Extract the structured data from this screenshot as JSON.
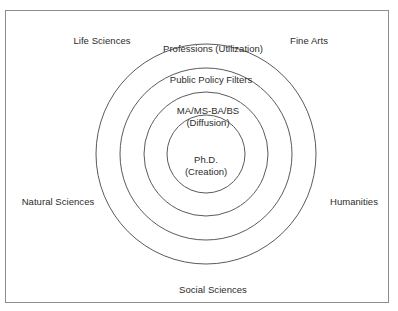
{
  "diagram": {
    "type": "concentric-circles",
    "title": "",
    "background_color": "#ffffff",
    "border_color": "#8c8c8c",
    "ring_stroke_color": "#5a5a5a",
    "text_color": "#2b2b2b",
    "center": {
      "x": 206,
      "y": 154
    },
    "rings": [
      {
        "name": "outermost-ring",
        "label": "Professions (Utilization)",
        "radius": 110,
        "label_x": 213,
        "label_y": 43
      },
      {
        "name": "second-ring",
        "label": "Public Policy Filters",
        "radius": 86,
        "label_x": 211,
        "label_y": 74
      },
      {
        "name": "third-ring",
        "label": "MA/MS-BA/BS",
        "sublabel": "(Diffusion)",
        "radius": 62,
        "label_x": 208,
        "label_y": 105
      },
      {
        "name": "innermost-ring",
        "label": "Ph.D.",
        "sublabel": "(Creation)",
        "radius": 39,
        "label_x": 206,
        "label_y": 154
      }
    ],
    "discipline_labels": [
      {
        "name": "life-sciences",
        "text": "Life Sciences",
        "x": 102,
        "y": 35
      },
      {
        "name": "fine-arts",
        "text": "Fine Arts",
        "x": 309,
        "y": 35
      },
      {
        "name": "natural-sciences",
        "text": "Natural Sciences",
        "x": 58,
        "y": 196
      },
      {
        "name": "humanities",
        "text": "Humanities",
        "x": 354,
        "y": 196
      },
      {
        "name": "social-sciences",
        "text": "Social Sciences",
        "x": 213,
        "y": 284
      }
    ]
  }
}
